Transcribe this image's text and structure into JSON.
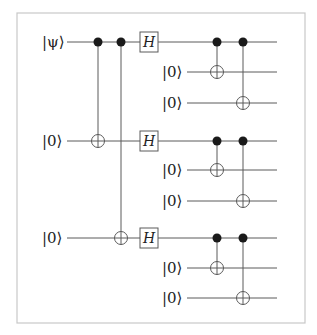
{
  "diagram": {
    "type": "quantum-circuit",
    "colors": {
      "line": "#5a5a5a",
      "border": "#c8c8c8",
      "dot": "#1a1a1a",
      "text": "#222222"
    },
    "frame": {
      "x": 17,
      "y": 13,
      "width": 288,
      "height": 310
    },
    "wire_end_x": 277,
    "qubits": [
      {
        "id": "q0",
        "label": "|ψ⟩",
        "y": 42,
        "x_start": 67,
        "label_x": 42
      },
      {
        "id": "q1",
        "label": "|0⟩",
        "y": 72,
        "x_start": 187,
        "label_x": 162
      },
      {
        "id": "q2",
        "label": "|0⟩",
        "y": 103,
        "x_start": 187,
        "label_x": 162
      },
      {
        "id": "q3",
        "label": "|0⟩",
        "y": 141,
        "x_start": 67,
        "label_x": 42
      },
      {
        "id": "q4",
        "label": "|0⟩",
        "y": 170,
        "x_start": 187,
        "label_x": 162
      },
      {
        "id": "q5",
        "label": "|0⟩",
        "y": 201,
        "x_start": 187,
        "label_x": 162
      },
      {
        "id": "q6",
        "label": "|0⟩",
        "y": 238,
        "x_start": 67,
        "label_x": 42
      },
      {
        "id": "q7",
        "label": "|0⟩",
        "y": 268,
        "x_start": 187,
        "label_x": 162
      },
      {
        "id": "q8",
        "label": "|0⟩",
        "y": 298,
        "x_start": 187,
        "label_x": 162
      }
    ],
    "gates": [
      {
        "type": "CNOT",
        "x": 98,
        "control": "q0",
        "target": "q3"
      },
      {
        "type": "CNOT",
        "x": 121,
        "control": "q0",
        "target": "q6"
      },
      {
        "type": "H",
        "x": 149,
        "qubit": "q0",
        "label": "H"
      },
      {
        "type": "H",
        "x": 149,
        "qubit": "q3",
        "label": "H"
      },
      {
        "type": "H",
        "x": 149,
        "qubit": "q6",
        "label": "H"
      },
      {
        "type": "CNOT",
        "x": 217,
        "control": "q0",
        "target": "q1"
      },
      {
        "type": "CNOT",
        "x": 243,
        "control": "q0",
        "target": "q2"
      },
      {
        "type": "CNOT",
        "x": 217,
        "control": "q3",
        "target": "q4"
      },
      {
        "type": "CNOT",
        "x": 243,
        "control": "q3",
        "target": "q5"
      },
      {
        "type": "CNOT",
        "x": 217,
        "control": "q6",
        "target": "q7"
      },
      {
        "type": "CNOT",
        "x": 243,
        "control": "q6",
        "target": "q8"
      }
    ]
  }
}
